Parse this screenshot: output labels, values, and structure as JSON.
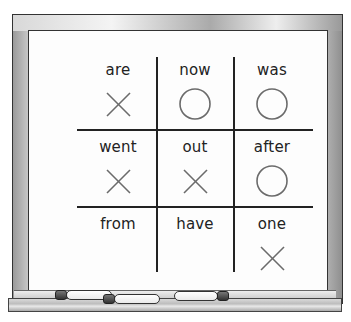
{
  "board": {
    "grid": [
      {
        "word": "are",
        "mark": "x"
      },
      {
        "word": "now",
        "mark": "o"
      },
      {
        "word": "was",
        "mark": "o"
      },
      {
        "word": "went",
        "mark": "x"
      },
      {
        "word": "out",
        "mark": "x"
      },
      {
        "word": "after",
        "mark": "o"
      },
      {
        "word": "from",
        "mark": ""
      },
      {
        "word": "have",
        "mark": ""
      },
      {
        "word": "one",
        "mark": "x"
      }
    ],
    "colors": {
      "frame": "#c8c8c8",
      "board": "#fdfdfd",
      "ink": "#222222",
      "mark": "#6b6b6b"
    }
  },
  "tray": {
    "markers": [
      "marker-1",
      "marker-2",
      "marker-3"
    ]
  }
}
